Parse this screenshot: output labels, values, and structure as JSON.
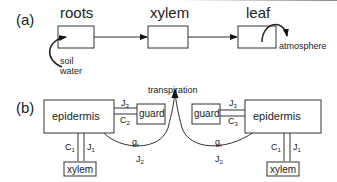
{
  "panel_a": {
    "label": "(a)",
    "nodes": {
      "roots": "roots",
      "xylem": "xylem",
      "leaf": "leaf"
    },
    "soil_water": [
      "soil",
      "water"
    ],
    "atmosphere": "atmosphere"
  },
  "panel_b": {
    "label": "(b)",
    "transpiration": "transpiration",
    "left": {
      "epidermis": "epidermis",
      "guard": "guard",
      "xylem": "xylem",
      "J_top": {
        "sym": "J",
        "sub": "3"
      },
      "C_guard": {
        "sym": "C",
        "sub": "2"
      },
      "C_xylem": {
        "sym": "C",
        "sub": "1"
      },
      "J_xylem": {
        "sym": "J",
        "sub": "1"
      },
      "g": {
        "sym": "g",
        "sub": "t"
      },
      "J_arc": {
        "sym": "J",
        "sub": "2"
      }
    },
    "right": {
      "epidermis": "epidermis",
      "guard": "guard",
      "xylem": "xylem",
      "J_top": {
        "sym": "J",
        "sub": "3"
      },
      "C_guard": {
        "sym": "C",
        "sub": "3"
      },
      "C_xylem": {
        "sym": "C",
        "sub": "1"
      },
      "J_xylem": {
        "sym": "J",
        "sub": "1"
      },
      "g": {
        "sym": "g",
        "sub": "t"
      },
      "J_arc": {
        "sym": "J",
        "sub": "2"
      }
    }
  }
}
